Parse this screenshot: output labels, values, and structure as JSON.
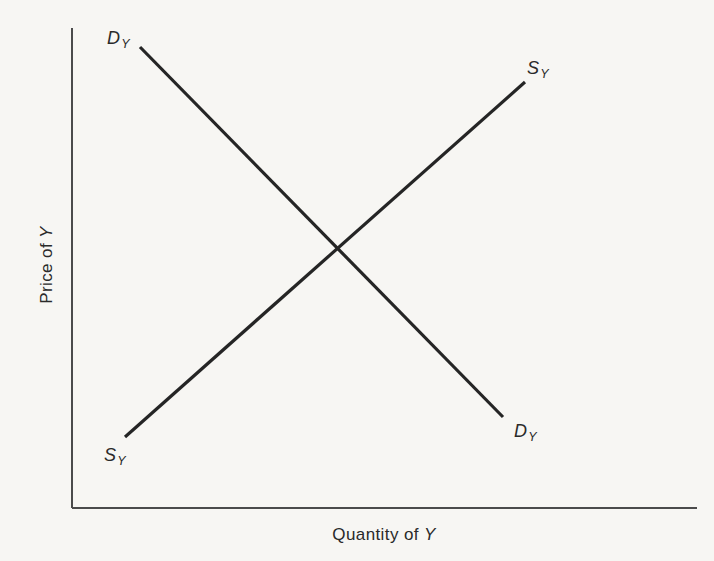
{
  "page": {
    "background_color": "#f7f6f3",
    "ink_color": "#2a2a2a"
  },
  "chart_data": {
    "type": "line",
    "title": "",
    "xlabel": "Quantity of Y",
    "ylabel": "Price of Y",
    "grid": false,
    "legend": "none",
    "tick_labels": "none (qualitative diagram)",
    "series": [
      {
        "name": "demand",
        "label": "DY",
        "label_main": "D",
        "label_sub": "Y",
        "direction": "downward-sloping",
        "x_axis_fraction": [
          0.109,
          0.69
        ],
        "y_axis_fraction": [
          0.96,
          0.19
        ],
        "px": {
          "x1": 140,
          "y1": 47,
          "x2": 503,
          "y2": 417
        }
      },
      {
        "name": "supply",
        "label": "SY",
        "label_main": "S",
        "label_sub": "Y",
        "direction": "upward-sloping",
        "x_axis_fraction": [
          0.085,
          0.725
        ],
        "y_axis_fraction": [
          0.148,
          0.888
        ],
        "px": {
          "x1": 125,
          "y1": 437,
          "x2": 525,
          "y2": 82
        }
      }
    ],
    "equilibrium_axis_fraction": {
      "x": 0.425,
      "y": 0.541
    },
    "axes_px": {
      "origin_x": 72,
      "origin_y": 508,
      "y_top": 28,
      "x_right": 697
    }
  },
  "labels": {
    "demand_top": {
      "main": "D",
      "sub": "Y"
    },
    "demand_bottom": {
      "main": "D",
      "sub": "Y"
    },
    "supply_top": {
      "main": "S",
      "sub": "Y"
    },
    "supply_bottom": {
      "main": "S",
      "sub": "Y"
    },
    "y_axis": {
      "text": "Price of",
      "var": "Y"
    },
    "x_axis": {
      "text": "Quantity of",
      "var": "Y"
    }
  }
}
